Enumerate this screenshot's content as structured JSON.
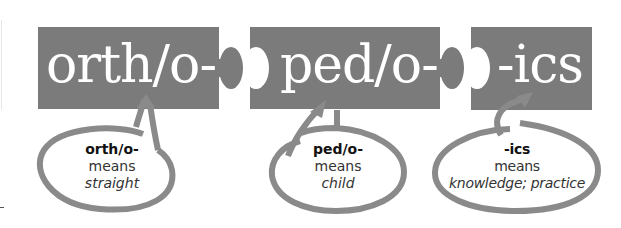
{
  "colors": {
    "piece_fill": "#7b7b7b",
    "oval_stroke": "#8a8a8a",
    "background": "#ffffff",
    "term_text": "#ffffff"
  },
  "parts": [
    {
      "term": "orth/o-",
      "definition": {
        "word": "orth/o-",
        "means_label": "means",
        "meaning": "straight"
      }
    },
    {
      "term": "ped/o-",
      "definition": {
        "word": "ped/o-",
        "means_label": "means",
        "meaning": "child"
      }
    },
    {
      "term": "-ics",
      "definition": {
        "word": "-ics",
        "means_label": "means",
        "meaning": "knowledge; practice"
      }
    }
  ]
}
